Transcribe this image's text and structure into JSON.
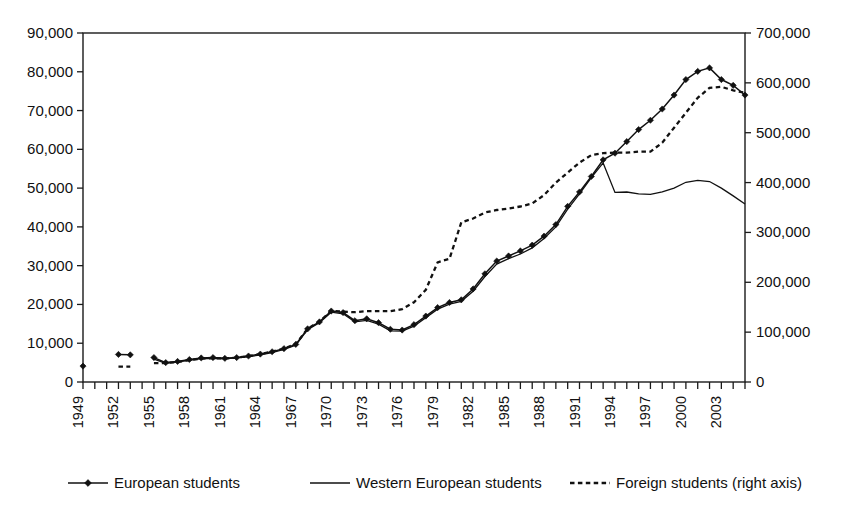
{
  "chart_data": {
    "type": "line",
    "title": "",
    "xlabel": "",
    "ylabel": "",
    "y2label": "",
    "grid": false,
    "legend_position": "bottom",
    "xlim": [
      1949,
      2005
    ],
    "ylim": [
      0,
      90000
    ],
    "y2lim": [
      0,
      700000
    ],
    "x_tick_labels": [
      "1949",
      "1952",
      "1955",
      "1958",
      "1961",
      "1964",
      "1967",
      "1970",
      "1973",
      "1976",
      "1979",
      "1982",
      "1985",
      "1988",
      "1991",
      "1994",
      "1997",
      "2000",
      "2003"
    ],
    "x_tick_step_years": 3,
    "x_minor_tick_step_years": 1,
    "y_tick_labels": [
      "0",
      "10,000",
      "20,000",
      "30,000",
      "40,000",
      "50,000",
      "60,000",
      "70,000",
      "80,000",
      "90,000"
    ],
    "y_tick_values": [
      0,
      10000,
      20000,
      30000,
      40000,
      50000,
      60000,
      70000,
      80000,
      90000
    ],
    "y2_tick_labels": [
      "0",
      "100,000",
      "200,000",
      "300,000",
      "400,000",
      "500,000",
      "600,000",
      "700,000"
    ],
    "y2_tick_values": [
      0,
      100000,
      200000,
      300000,
      400000,
      500000,
      600000,
      700000
    ],
    "series": [
      {
        "name": "European students",
        "axis": "left",
        "style": "line-with-diamond-markers",
        "segments": [
          {
            "x": [
              1949
            ],
            "values": [
              4100
            ]
          },
          {
            "x": [
              1952,
              1953
            ],
            "values": [
              7100,
              7000
            ]
          },
          {
            "x": [
              1955,
              1956,
              1957,
              1958,
              1959,
              1960,
              1961,
              1962,
              1963,
              1964,
              1965,
              1966,
              1967,
              1968,
              1969,
              1970,
              1971,
              1972,
              1973,
              1974,
              1975,
              1976,
              1977,
              1978,
              1979,
              1980,
              1981,
              1982,
              1983,
              1984,
              1985,
              1986,
              1987,
              1988,
              1989,
              1990,
              1991,
              1992,
              1993,
              1994,
              1995,
              1996,
              1997,
              1998,
              1999,
              2000,
              2001,
              2002,
              2003,
              2004,
              2005
            ],
            "values": [
              6300,
              5000,
              5300,
              5800,
              6200,
              6300,
              6100,
              6300,
              6700,
              7200,
              7800,
              8600,
              9700,
              13700,
              15500,
              18300,
              17900,
              15800,
              16300,
              15300,
              13600,
              13400,
              14800,
              17000,
              19200,
              20500,
              21200,
              24000,
              27900,
              31200,
              32500,
              33800,
              35300,
              37600,
              40600,
              45300,
              49000,
              53000,
              57300,
              59000,
              62000,
              65100,
              67500,
              70400,
              74000,
              78000,
              80100,
              81000,
              78000,
              76500,
              74000
            ]
          }
        ]
      },
      {
        "name": "Western European students",
        "axis": "left",
        "style": "solid-line",
        "segments": [
          {
            "x": [
              1955,
              1956,
              1957,
              1958,
              1959,
              1960,
              1961,
              1962,
              1963,
              1964,
              1965,
              1966,
              1967,
              1968,
              1969,
              1970,
              1971,
              1972,
              1973,
              1974,
              1975,
              1976,
              1977,
              1978,
              1979,
              1980,
              1981,
              1982,
              1983,
              1984,
              1985,
              1986,
              1987,
              1988,
              1989,
              1990,
              1991,
              1992,
              1993,
              1994,
              1995,
              1996,
              1997,
              1998,
              1999,
              2000,
              2001,
              2002,
              2003,
              2004,
              2005
            ],
            "values": [
              5900,
              4800,
              5200,
              5600,
              6000,
              6100,
              6000,
              6200,
              6500,
              7000,
              7600,
              8400,
              9500,
              13500,
              15300,
              18000,
              17600,
              15500,
              15900,
              14900,
              13200,
              13100,
              14400,
              16600,
              18800,
              20100,
              20800,
              23400,
              27200,
              30400,
              31800,
              33000,
              34600,
              37000,
              40000,
              44600,
              48500,
              52700,
              56500,
              48900,
              49000,
              48500,
              48400,
              49000,
              50000,
              51500,
              52000,
              51700,
              50000,
              48000,
              45900
            ]
          }
        ]
      },
      {
        "name": "Foreign students (right axis)",
        "axis": "right",
        "style": "dotted-line",
        "segments": [
          {
            "x": [
              1952,
              1953
            ],
            "values": [
              31000,
              31000
            ]
          },
          {
            "x": [
              1955,
              1956,
              1957,
              1958,
              1959,
              1960,
              1961,
              1962,
              1963,
              1964,
              1965,
              1966,
              1967,
              1968,
              1969,
              1970,
              1971,
              1972,
              1973,
              1974,
              1975,
              1976,
              1977,
              1978,
              1979,
              1980,
              1981,
              1982,
              1983,
              1984,
              1985,
              1986,
              1987,
              1988,
              1989,
              1990,
              1991,
              1992,
              1993,
              1994,
              1995,
              1996,
              1997,
              1998,
              1999,
              2000,
              2001,
              2002,
              2003,
              2004,
              2005
            ],
            "values": [
              38000,
              38000,
              40000,
              44000,
              47000,
              48000,
              47000,
              49000,
              52000,
              56000,
              61000,
              67000,
              76000,
              107000,
              121000,
              143000,
              141000,
              140000,
              142000,
              142000,
              142000,
              146000,
              160000,
              185000,
              240000,
              247000,
              320000,
              328000,
              340000,
              345000,
              348000,
              352000,
              358000,
              375000,
              400000,
              420000,
              440000,
              455000,
              459000,
              460000,
              460000,
              462000,
              462000,
              480000,
              510000,
              540000,
              570000,
              590000,
              592000,
              585000,
              580000
            ]
          }
        ]
      }
    ]
  },
  "legend": {
    "items": [
      {
        "label": "European students",
        "marker": "line-diamond"
      },
      {
        "label": "Western European students",
        "marker": "line-solid"
      },
      {
        "label": "Foreign students (right axis)",
        "marker": "line-dotted"
      }
    ]
  }
}
